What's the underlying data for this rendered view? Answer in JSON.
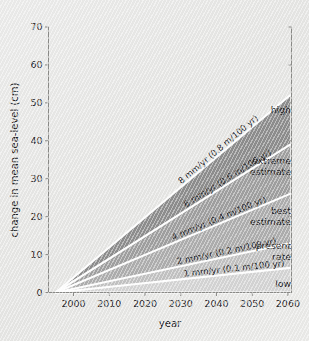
{
  "chart_data": {
    "type": "area",
    "title": "",
    "xlabel": "year",
    "ylabel": "change in mean sea-level (cm)",
    "xlim": [
      1993,
      2061
    ],
    "ylim": [
      0,
      70
    ],
    "origin": {
      "x": 1995,
      "y": 0
    },
    "xticks": [
      "2000",
      "2010",
      "2020",
      "2030",
      "2040",
      "2050",
      "2060"
    ],
    "xtick_values": [
      2000,
      2010,
      2020,
      2030,
      2040,
      2050,
      2060
    ],
    "yticks": [
      "0",
      "10",
      "20",
      "30",
      "40",
      "50",
      "60",
      "70"
    ],
    "ytick_values": [
      0,
      10,
      20,
      30,
      40,
      50,
      60,
      70
    ],
    "grid": false,
    "legend": "none",
    "series": [
      {
        "name": "8 mm/yr",
        "label": "8 mm/yr (0.8 m/100 yr)",
        "rate_mm_per_yr": 8,
        "rate_m_per_100yr": 0.8,
        "value_2060_cm": 52,
        "color": "#8e8e8e"
      },
      {
        "name": "6 mm/yr",
        "label": "6 mm/yr (0.6 m/100 yr)",
        "rate_mm_per_yr": 6,
        "rate_m_per_100yr": 0.6,
        "value_2060_cm": 39,
        "color": "#a0a0a0"
      },
      {
        "name": "4 mm/yr",
        "label": "4 mm/yr (0.4 m/100 yr)",
        "rate_mm_per_yr": 4,
        "rate_m_per_100yr": 0.4,
        "value_2060_cm": 26,
        "color": "#aeaeae"
      },
      {
        "name": "2 mm/yr",
        "label": "2 mm/yr (0.2 m/100 yr)",
        "rate_mm_per_yr": 2,
        "rate_m_per_100yr": 0.2,
        "value_2060_cm": 13,
        "color": "#c2c2c2"
      },
      {
        "name": "1 mm/yr",
        "label": "1 mm/yr (0.1 m/100 yr)",
        "rate_mm_per_yr": 1,
        "rate_m_per_100yr": 0.1,
        "value_2060_cm": 6.5,
        "color": "#d4d4d4"
      }
    ],
    "annotations": [
      {
        "text": "high",
        "at_year": 2060,
        "at_cm": 56
      },
      {
        "text": "extreme",
        "at_year": 2058,
        "at_cm": 42
      },
      {
        "text": "estimate",
        "at_year": 2058,
        "at_cm": 38.5
      },
      {
        "text": "best",
        "at_year": 2058,
        "at_cm": 28.5
      },
      {
        "text": "estimate",
        "at_year": 2058,
        "at_cm": 25
      },
      {
        "text": "present",
        "at_year": 2058,
        "at_cm": 18
      },
      {
        "text": "rate",
        "at_year": 2058,
        "at_cm": 14.8
      },
      {
        "text": "low",
        "at_year": 2060,
        "at_cm": 2.5
      }
    ]
  },
  "axes": {
    "x_title": "year",
    "y_title": "change in mean sea-level (cm)"
  },
  "labels": {
    "high": "high",
    "extreme": "extreme",
    "extreme_estimate": "estimate",
    "best": "best",
    "best_estimate": "estimate",
    "present": "present",
    "present_rate": "rate",
    "low": "low"
  },
  "colors": {
    "background": "#e9e9e7",
    "axis": "#8b8b88",
    "separator": "#ffffff",
    "text": "#1b1b1e",
    "band_8": "#8e8e8e",
    "band_6": "#a0a0a0",
    "band_4": "#aeaeae",
    "band_2": "#c2c2c2",
    "band_1": "#d4d4d4"
  }
}
